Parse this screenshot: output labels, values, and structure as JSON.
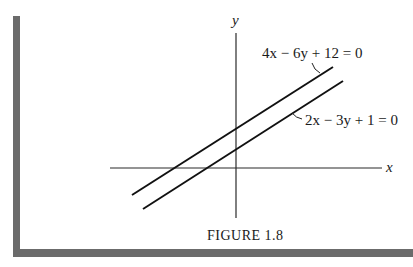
{
  "figure": {
    "caption": "Figure 1.8",
    "caption_display": "FIGURE 1.8",
    "axes": {
      "x_label": "x",
      "y_label": "y"
    },
    "lines": [
      {
        "equation": "4x − 6y + 12 = 0",
        "position": "upper"
      },
      {
        "equation": "2x − 3y + 1 = 0",
        "position": "lower"
      }
    ],
    "colors": {
      "ink": "#1a1a1a",
      "frame": "#6b6b6b",
      "background": "#ffffff"
    }
  }
}
